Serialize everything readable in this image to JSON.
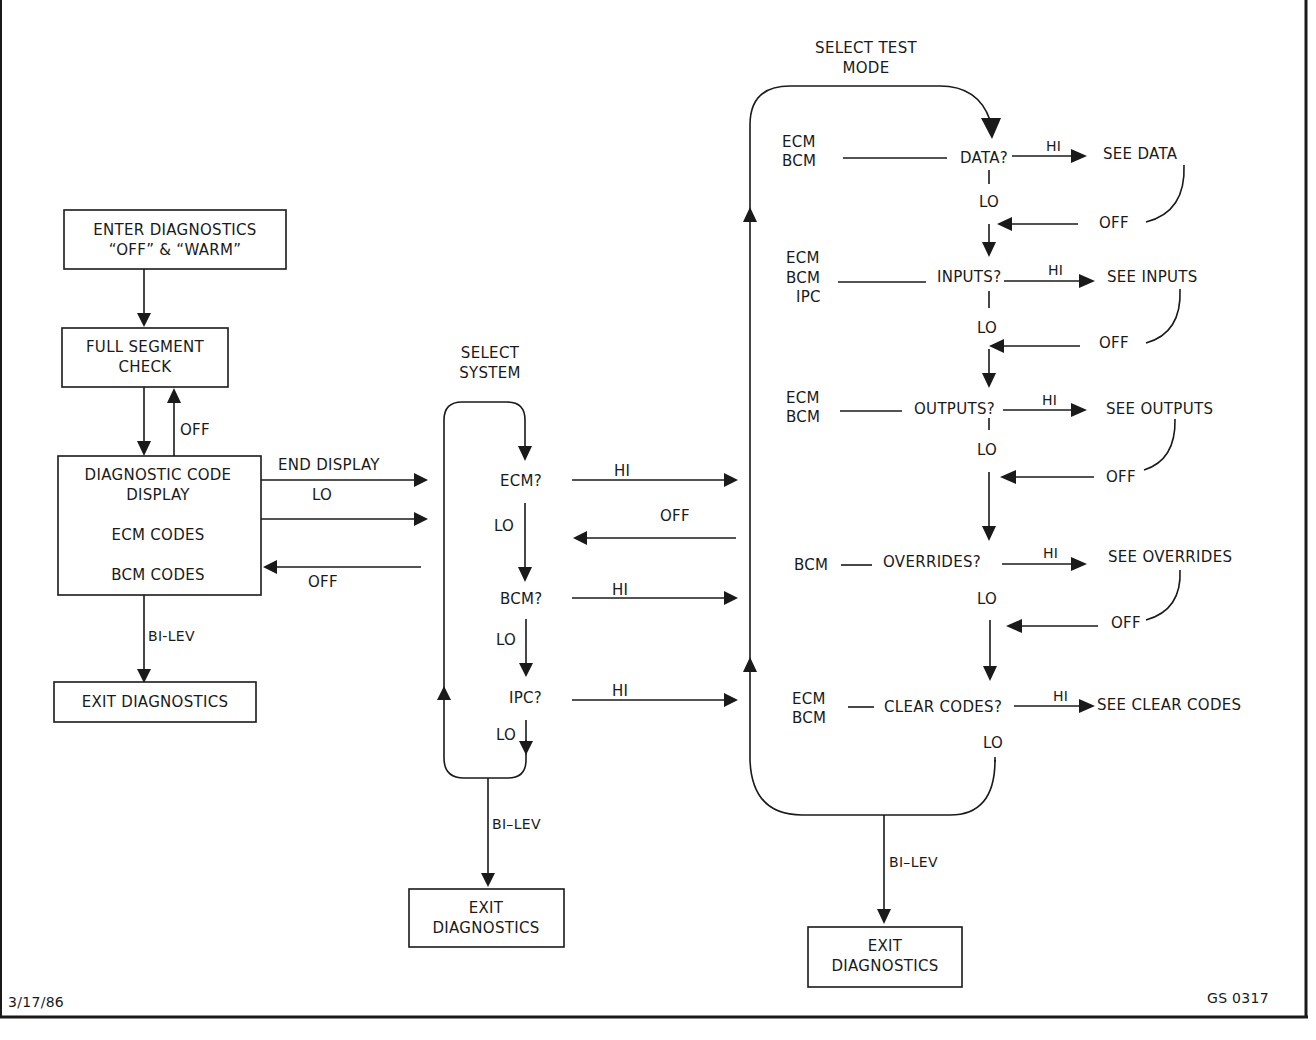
{
  "figure": {
    "date": "3/17/86",
    "figure_id": "GS 0317"
  },
  "left": {
    "enter_box": [
      "ENTER DIAGNOSTICS",
      "“OFF” & “WARM”"
    ],
    "segment_box": [
      "FULL SEGMENT",
      "CHECK"
    ],
    "off_label": "OFF",
    "code_box": [
      "DIAGNOSTIC CODE",
      "DISPLAY",
      "ECM CODES",
      "BCM CODES"
    ],
    "end_display_label": "END DISPLAY",
    "lo_label": "LO",
    "off_return_label": "OFF",
    "bilev_label": "BI-LEV",
    "exit_box": "EXIT DIAGNOSTICS"
  },
  "select_system": {
    "title": [
      "SELECT",
      "SYSTEM"
    ],
    "items": [
      {
        "label": "ECM?",
        "hi": "HI",
        "lo": "LO"
      },
      {
        "label": "BCM?",
        "hi": "HI",
        "lo": "LO"
      },
      {
        "label": "IPC?",
        "hi": "HI",
        "lo": "LO"
      }
    ],
    "off_label": "OFF",
    "bilev_label": "BI–LEV",
    "exit_box": [
      "EXIT",
      "DIAGNOSTICS"
    ]
  },
  "select_test_mode": {
    "title": [
      "SELECT TEST",
      "MODE"
    ],
    "modes": [
      {
        "systems": [
          "ECM",
          "BCM"
        ],
        "label": "DATA?",
        "hi": "HI",
        "result": "SEE DATA",
        "lo": "LO",
        "off": "OFF"
      },
      {
        "systems": [
          "ECM",
          "BCM",
          "IPC"
        ],
        "label": "INPUTS?",
        "hi": "HI",
        "result": "SEE INPUTS",
        "lo": "LO",
        "off": "OFF"
      },
      {
        "systems": [
          "ECM",
          "BCM"
        ],
        "label": "OUTPUTS?",
        "hi": "HI",
        "result": "SEE OUTPUTS",
        "lo": "LO",
        "off": "OFF"
      },
      {
        "systems": [
          "BCM"
        ],
        "label": "OVERRIDES?",
        "hi": "HI",
        "result": "SEE OVERRIDES",
        "lo": "LO",
        "off": "OFF"
      },
      {
        "systems": [
          "ECM",
          "BCM"
        ],
        "label": "CLEAR CODES?",
        "hi": "HI",
        "result": "SEE CLEAR CODES",
        "lo": "LO"
      }
    ],
    "bilev_label": "BI–LEV",
    "exit_box": [
      "EXIT",
      "DIAGNOSTICS"
    ]
  }
}
